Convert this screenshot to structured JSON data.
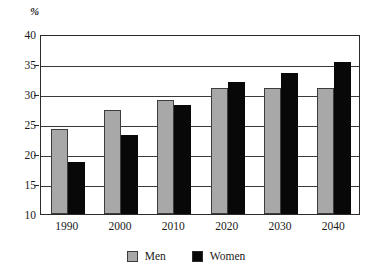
{
  "chart_data": {
    "type": "bar",
    "title": "",
    "xlabel": "",
    "ylabel": "%",
    "unit_label": "%",
    "categories": [
      "1990",
      "2000",
      "2010",
      "2020",
      "2030",
      "2040"
    ],
    "series": [
      {
        "name": "Men",
        "color": "#a8a8a8",
        "values": [
          24.2,
          27.4,
          29.0,
          31.0,
          31.0,
          31.0
        ]
      },
      {
        "name": "Women",
        "color": "#080808",
        "values": [
          18.6,
          23.1,
          28.1,
          32.0,
          33.5,
          35.3
        ]
      }
    ],
    "ylim": [
      10,
      40
    ],
    "ytick_values": [
      10,
      15,
      20,
      25,
      30,
      35,
      40
    ],
    "ytick_labels": [
      "10",
      "15",
      "20",
      "25",
      "30",
      "35",
      "40"
    ],
    "grid": true,
    "grid_axis": "y",
    "legend": {
      "position": "bottom",
      "entries": [
        {
          "label": "Men",
          "swatch": "men"
        },
        {
          "label": "Women",
          "swatch": "women"
        }
      ]
    },
    "frame": true,
    "axis_color": "#2b2b2b"
  }
}
